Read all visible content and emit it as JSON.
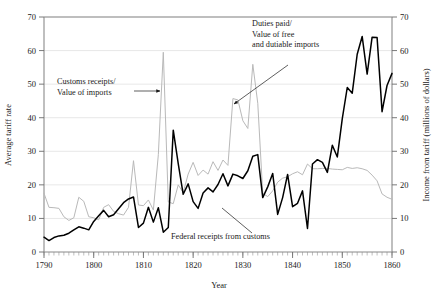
{
  "chart_data": {
    "type": "line",
    "title": "",
    "xlabel": "Year",
    "ylabel": "Average tariff rate",
    "y2label": "Income from tariff (millions of dollars)",
    "xlim": [
      1790,
      1860
    ],
    "ylim": [
      0,
      70
    ],
    "y2lim": [
      0,
      70
    ],
    "grid": true,
    "legend_position": "inline-annotations",
    "xticks": [
      1790,
      1800,
      1810,
      1820,
      1830,
      1840,
      1850,
      1860
    ],
    "xtick_labels": [
      "1790",
      "1800",
      "1810",
      "1820",
      "1830",
      "1840",
      "1850",
      "1860"
    ],
    "yticks": [
      0,
      10,
      20,
      30,
      40,
      50,
      60,
      70
    ],
    "ytick_labels": [
      "0",
      "10",
      "20",
      "30",
      "40",
      "50",
      "60",
      "70"
    ],
    "y2ticks": [
      0,
      10,
      20,
      30,
      40,
      50,
      60,
      70
    ],
    "y2tick_labels": [
      "0",
      "10",
      "20",
      "30",
      "40",
      "50",
      "60",
      "70"
    ],
    "minor_xticks": true,
    "annotations": [
      {
        "id": "customs-receipts",
        "text_lines": [
          "Customs receipts/",
          "Value of imports"
        ],
        "x": 57,
        "y": 84,
        "arrow_from": [
          134,
          91
        ],
        "arrow_to": [
          160,
          91
        ],
        "arrow_style": "solid-head"
      },
      {
        "id": "duties-paid",
        "text_lines": [
          "Duties paid/",
          "Value of free",
          "and dutiable imports"
        ],
        "x": 252,
        "y": 26,
        "arrow_from": [
          288,
          65
        ],
        "arrow_to": [
          234,
          104
        ],
        "arrow_style": "solid-head"
      },
      {
        "id": "federal-receipts",
        "text_lines": [
          "Federal receipts from customs"
        ],
        "x": 171,
        "y": 239,
        "arrow_from": [
          252,
          233
        ],
        "arrow_to": [
          222,
          208
        ],
        "arrow_style": "line"
      }
    ],
    "series": [
      {
        "name": "Federal receipts from customs",
        "color": "#000000",
        "width": 1.5,
        "axis": "right",
        "x": [
          1790,
          1791,
          1792,
          1793,
          1794,
          1795,
          1796,
          1797,
          1798,
          1799,
          1800,
          1801,
          1802,
          1803,
          1804,
          1805,
          1806,
          1807,
          1808,
          1809,
          1810,
          1811,
          1812,
          1813,
          1814,
          1815,
          1816,
          1817,
          1818,
          1819,
          1820,
          1821,
          1822,
          1823,
          1824,
          1825,
          1826,
          1827,
          1828,
          1829,
          1830,
          1831,
          1832,
          1833,
          1834,
          1835,
          1836,
          1837,
          1838,
          1839,
          1840,
          1841,
          1842,
          1843,
          1844,
          1845,
          1846,
          1847,
          1848,
          1849,
          1850,
          1851,
          1852,
          1853,
          1854,
          1855,
          1856,
          1857,
          1858,
          1859,
          1860
        ],
        "values": [
          4.4,
          3.4,
          4.3,
          4.8,
          5.0,
          5.6,
          6.6,
          7.5,
          7.1,
          6.6,
          9.1,
          10.8,
          12.4,
          10.5,
          11.1,
          12.9,
          14.7,
          15.8,
          16.4,
          7.3,
          8.6,
          13.3,
          8.9,
          13.2,
          5.9,
          7.3,
          36.3,
          26.3,
          17.2,
          20.3,
          15.0,
          13.0,
          17.6,
          19.1,
          17.9,
          20.1,
          23.3,
          19.7,
          23.2,
          22.7,
          21.9,
          24.2,
          28.5,
          29.0,
          16.2,
          19.4,
          23.4,
          11.2,
          16.2,
          23.1,
          13.5,
          14.5,
          18.2,
          7.0,
          26.2,
          27.5,
          26.7,
          23.7,
          31.8,
          28.3,
          39.7,
          49.0,
          47.3,
          58.9,
          64.2,
          53.0,
          64.0,
          63.9,
          41.8,
          49.6,
          53.2
        ]
      },
      {
        "name": "Customs receipts / Value of imports",
        "color": "#b9b9b9",
        "width": 1.0,
        "axis": "left",
        "x": [
          1790,
          1791,
          1792,
          1793,
          1794,
          1795,
          1796,
          1797,
          1798,
          1799,
          1800,
          1801,
          1802,
          1803,
          1804,
          1805,
          1806,
          1807,
          1808,
          1809,
          1810,
          1811,
          1812,
          1813,
          1814,
          1815,
          1816,
          1817,
          1818,
          1819,
          1820,
          1821,
          1822,
          1823,
          1824,
          1825,
          1826,
          1827,
          1828,
          1829,
          1830,
          1831,
          1832,
          1833,
          1834,
          1835,
          1836,
          1837,
          1838,
          1839,
          1840,
          1841,
          1842,
          1843,
          1844,
          1845,
          1846,
          1847,
          1848,
          1849,
          1850,
          1851,
          1852,
          1853,
          1854,
          1855,
          1856,
          1857,
          1858,
          1859,
          1860
        ],
        "values": [
          17.5,
          13.3,
          13.2,
          13.0,
          10.5,
          9.4,
          10.2,
          16.3,
          15.1,
          10.5,
          10.2,
          9.6,
          13.3,
          14.1,
          12.1,
          11.4,
          11.0,
          13.3,
          27.2,
          14.0,
          13.8,
          15.5,
          12.5,
          29.0,
          59.5,
          14.9,
          14.4,
          20.0,
          17.7,
          23.2,
          26.7,
          22.8,
          24.4,
          23.2,
          26.9,
          24.3,
          27.4,
          25.8,
          45.7,
          45.3,
          39.1,
          36.8,
          55.9,
          44.3,
          17.5,
          16.5,
          18.2,
          20.8,
          22.0,
          22.4,
          23.3,
          23.9,
          23.0,
          26.2,
          24.8,
          24.8,
          24.9,
          24.9,
          24.7,
          24.6,
          24.5,
          25.2,
          24.9,
          25.1,
          24.8,
          24.3,
          22.9,
          21.2,
          17.3,
          16.3,
          15.7
        ]
      }
    ]
  }
}
